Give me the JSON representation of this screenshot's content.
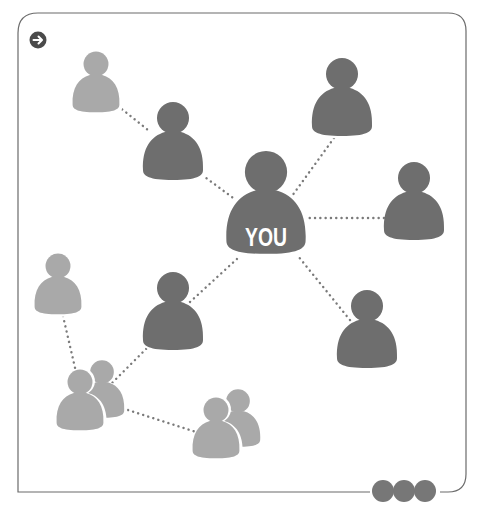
{
  "diagram": {
    "type": "social-network",
    "center_label": "YOU",
    "colors": {
      "dark_person": "#6e6e6e",
      "light_person": "#a9a9a9",
      "outline": "#ffffff",
      "frame": "#6b6b6b",
      "link": "#7a7a7a",
      "arrow_badge": "#4a4a4a",
      "dots": "#777777"
    },
    "nodes": [
      {
        "id": "you",
        "label": "YOU",
        "tone": "dark",
        "role": "center"
      },
      {
        "id": "friend-top-left",
        "tone": "dark"
      },
      {
        "id": "friend-top-right",
        "tone": "dark"
      },
      {
        "id": "friend-right",
        "tone": "dark"
      },
      {
        "id": "friend-bottom-right",
        "tone": "dark"
      },
      {
        "id": "friend-middle-left",
        "tone": "dark"
      },
      {
        "id": "contact-far-top-left",
        "tone": "light"
      },
      {
        "id": "contact-far-left",
        "tone": "light"
      },
      {
        "id": "group-bottom-left",
        "tone": "light",
        "count": 2
      },
      {
        "id": "group-bottom-center",
        "tone": "light",
        "count": 2
      }
    ],
    "edges": [
      [
        "contact-far-top-left",
        "friend-top-left"
      ],
      [
        "friend-top-left",
        "you"
      ],
      [
        "friend-top-right",
        "you"
      ],
      [
        "friend-right",
        "you"
      ],
      [
        "friend-bottom-right",
        "you"
      ],
      [
        "friend-middle-left",
        "you"
      ],
      [
        "friend-middle-left",
        "group-bottom-left"
      ],
      [
        "contact-far-left",
        "group-bottom-left"
      ],
      [
        "group-bottom-left",
        "group-bottom-center"
      ]
    ]
  },
  "controls": {
    "next_icon": "arrow-right-icon",
    "more_icon": "more-dots-icon"
  }
}
